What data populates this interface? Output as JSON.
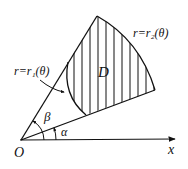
{
  "diagram": {
    "labels": {
      "origin": "O",
      "x_axis": "x",
      "alpha": "α",
      "beta": "β",
      "region": "D",
      "inner_curve": "r=r₁(θ)",
      "outer_curve": "r=r₂(θ)"
    },
    "colors": {
      "stroke": "#111111",
      "background": "#ffffff"
    }
  }
}
